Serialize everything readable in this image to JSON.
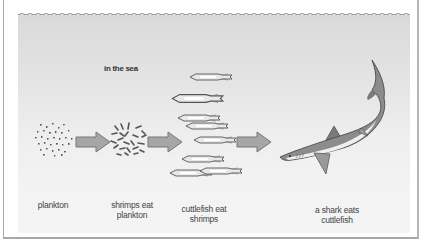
{
  "diagram": {
    "title": "in the sea",
    "colors": {
      "sea_top": "#d9d9d9",
      "sea_bottom": "#f4f4f4",
      "arrow_fill": "#a6a6a6",
      "arrow_stroke": "#777777",
      "shark_body": "#8c8c8c",
      "shark_belly": "#efefef"
    },
    "stages": [
      {
        "id": "plankton",
        "label": "plankton",
        "icon": "plankton-icon"
      },
      {
        "id": "shrimps",
        "label_line1": "shrimps eat",
        "label_line2": "plankton",
        "icon": "shrimp-icon"
      },
      {
        "id": "cuttlefish",
        "label_line1": "cuttlefish eat",
        "label_line2": "shrimps",
        "icon": "cuttlefish-icon"
      },
      {
        "id": "shark",
        "label_line1": "a shark eats",
        "label_line2": "cuttlefish",
        "icon": "shark-icon"
      }
    ],
    "arrows": [
      {
        "from": "plankton",
        "to": "shrimps"
      },
      {
        "from": "shrimps",
        "to": "cuttlefish"
      },
      {
        "from": "cuttlefish",
        "to": "shark"
      }
    ]
  }
}
